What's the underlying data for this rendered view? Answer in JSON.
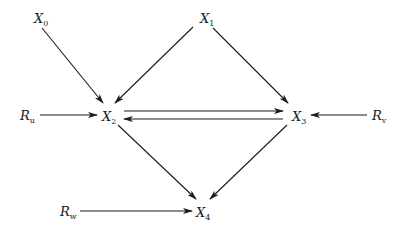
{
  "diagram": {
    "type": "directed-graph",
    "nodes": [
      {
        "id": "X0",
        "base": "X",
        "sub": "0",
        "x": 40,
        "y": 18
      },
      {
        "id": "X1",
        "base": "X",
        "sub": "1",
        "x": 208,
        "y": 18
      },
      {
        "id": "Ru",
        "base": "R",
        "sub": "u",
        "x": 28,
        "y": 115
      },
      {
        "id": "X2",
        "base": "X",
        "sub": "2",
        "x": 110,
        "y": 116
      },
      {
        "id": "X3",
        "base": "X",
        "sub": "3",
        "x": 298,
        "y": 116
      },
      {
        "id": "Rv",
        "base": "R",
        "sub": "v",
        "x": 378,
        "y": 115
      },
      {
        "id": "Rw",
        "base": "R",
        "sub": "w",
        "x": 68,
        "y": 211
      },
      {
        "id": "X4",
        "base": "X",
        "sub": "4",
        "x": 204,
        "y": 212
      }
    ],
    "edges": [
      {
        "from": "X0",
        "to": "X2",
        "x1": 42,
        "y1": 28,
        "x2": 103,
        "y2": 103
      },
      {
        "from": "X1",
        "to": "X2",
        "x1": 193,
        "y1": 27,
        "x2": 115,
        "y2": 103
      },
      {
        "from": "X1",
        "to": "X3",
        "x1": 213,
        "y1": 28,
        "x2": 288,
        "y2": 103
      },
      {
        "from": "Ru",
        "to": "X2",
        "x1": 40,
        "y1": 115,
        "x2": 97,
        "y2": 115
      },
      {
        "from": "X2",
        "to": "X3",
        "x1": 124,
        "y1": 111,
        "x2": 283,
        "y2": 111
      },
      {
        "from": "X3",
        "to": "X2",
        "x1": 283,
        "y1": 119,
        "x2": 124,
        "y2": 119
      },
      {
        "from": "Rv",
        "to": "X3",
        "x1": 367,
        "y1": 115,
        "x2": 311,
        "y2": 115
      },
      {
        "from": "X2",
        "to": "X4",
        "x1": 118,
        "y1": 125,
        "x2": 196,
        "y2": 199
      },
      {
        "from": "X3",
        "to": "X4",
        "x1": 287,
        "y1": 125,
        "x2": 210,
        "y2": 199
      },
      {
        "from": "Rw",
        "to": "X4",
        "x1": 80,
        "y1": 211,
        "x2": 192,
        "y2": 211
      }
    ]
  },
  "labels": {
    "X0": {
      "base": "X",
      "sub": "0"
    },
    "X1": {
      "base": "X",
      "sub": "1"
    },
    "X2": {
      "base": "X",
      "sub": "2"
    },
    "X3": {
      "base": "X",
      "sub": "3"
    },
    "X4": {
      "base": "X",
      "sub": "4"
    },
    "Ru": {
      "base": "R",
      "sub": "u"
    },
    "Rv": {
      "base": "R",
      "sub": "v"
    },
    "Rw": {
      "base": "R",
      "sub": "w"
    }
  }
}
